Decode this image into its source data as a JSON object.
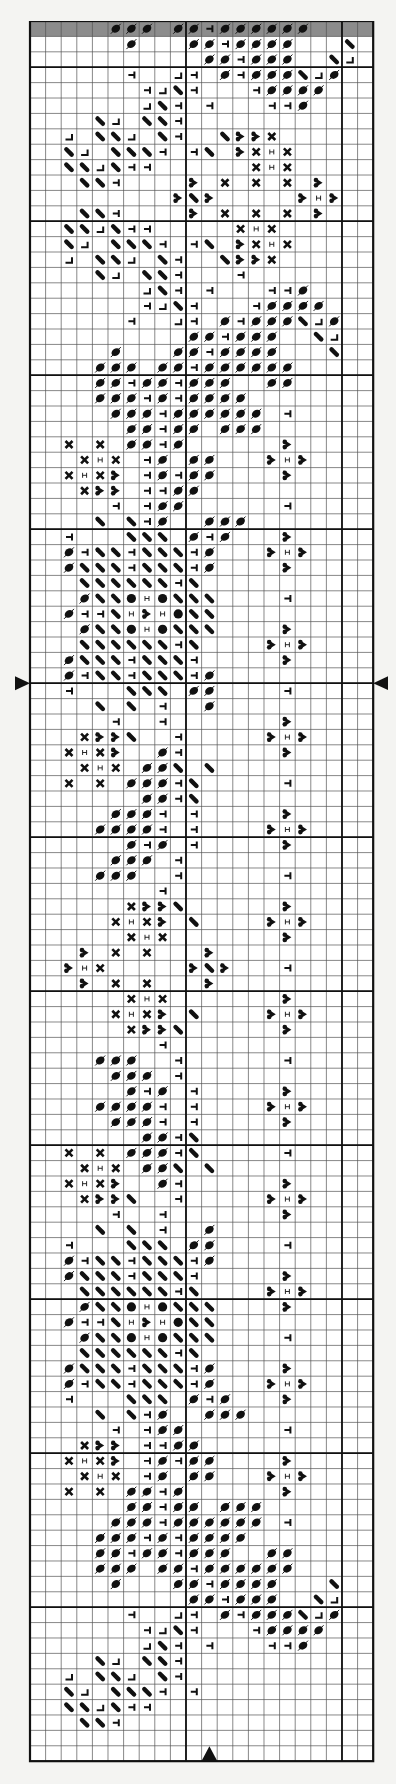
{
  "chart_data": {
    "type": "cross-stitch-pattern",
    "title": "",
    "columns": 22,
    "rows": 113,
    "cell_width": 15.6,
    "cell_height": 15.4,
    "bold_every": 10,
    "bold_row_offset": 3,
    "bold_columns": [
      10,
      20
    ],
    "shaded_rows": [
      0
    ],
    "center_markers": {
      "row_boundary": 43,
      "column": 11
    },
    "legend": {
      ".": "empty",
      "o": "oval-with-slash",
      "t": "tee-mark",
      "L": "corner-mark",
      "\\": "diagonal-bar",
      "h": "heart",
      "x": "cross",
      "I": "h-bar",
      "@": "filled-circle"
    },
    "grid": [
      ".....ooo.ootoooooo....",
      "......o...ootoooo...\\.",
      "...........ootooo..\\L.",
      "......t..Lt.otooo\\Lo..",
      ".......tL\\t...toooo...",
      ".......L\\t.t...tto....",
      "....\\L.\\\\t............",
      "..L.\\\\L.\\t..\\hhx......",
      "..\\L.\\\\\\t.t\\.hxIx.....",
      "..\\\\L\\tt......xIx.....",
      "...\\\\t....h.x.x.x.h...",
      ".........h\\h.....hIh..",
      "...\\\\t....h.x.x.x.h...",
      "..\\\\L\\tt.....xIx......",
      "..\\L.\\\\\\t.t\\.hxIx.....",
      "..L.\\\\L.\\t..\\hhx......",
      "....\\L.\\\\t...t........",
      ".......L\\t.t...tto....",
      ".......tL\\t...toooo...",
      "......t..Lt.otooo\\Lo..",
      "..........ootooo..\\L..",
      ".....o...ootoooo...\\..",
      "....ooo.ootoooooo.....",
      "....ootootooo..oo.....",
      "....ooototoooo........",
      ".....oootoooooo.t.....",
      "......ootoo.ooo.......",
      "..x.x.ooto......h.....",
      "...xIx.to.oo...hIh....",
      "..xIxh.totoo....h.....",
      "...xhh.ttoo...........",
      ".....t.too......t.....",
      "....\\.\\to..ooo........",
      "..t...\\\\\\.oto...h.....",
      "..ot\\\\t\\\\\\to...hIh....",
      "..o\\\\\\t\\\\\\to....h.....",
      "...\\\\\\\\\\\\t\\...........",
      "...o\\\\@I@\\\\\\....t.....",
      "..ott\\IhI@\\\\..........",
      "...o\\\\@I@\\\\\\....h.....",
      "...\\\\\\\\\\\\t\\....hIh....",
      "..o\\\\\\t\\\\\\t.....h.....",
      "..ot\\\\t\\\\\\to..........",
      "..t...\\\\\\.oo....t.....",
      "....\\.\\.t..o..........",
      ".....t..t.......h.....",
      "...xhh\\..t.....hIh....",
      "..xIxh..ot......h.....",
      "...xIx.oo\\.\\..........",
      "..x.x.ooot\\.....t.....",
      ".......oot\\...........",
      ".....ooot.t.....h.....",
      "....oooot.t....hIh....",
      "......oto.t.....h.....",
      ".....ooo.t............",
      "....ooo..t......t.....",
      "........t.............",
      "......xhh\\......h.....",
      ".....xIxh.\\....hIh....",
      "......xIx.......h.....",
      "...h.x.x...h..........",
      "..hIx.....h\\h...t.....",
      "...h.x.x...h..........",
      "......xIx.......h.....",
      ".....xIxh.\\....hIh....",
      "......xhh\\......h.....",
      "........t.............",
      "....ooo..t......t.....",
      ".....ooo.t............",
      "......oto.t.....h.....",
      "....oooot.t....hIh....",
      ".....ooot.t.....h.....",
      ".......oot\\...........",
      "..x.x.ooot\\.....t.....",
      "...xIx.oo\\.\\..........",
      "..xIxh..ot......h.....",
      "...xhh\\..t.....hIh....",
      ".....t..t.......h.....",
      "....\\.\\.t..o..........",
      "..t...\\\\\\.oo....t.....",
      "..ot\\\\t\\\\\\to..........",
      "..o\\\\\\t\\\\\\t.....h.....",
      "...\\\\\\\\\\\\t\\....hIh....",
      "...o\\\\@I@\\\\\\....h.....",
      "..ott\\IhI@\\\\..........",
      "...o\\\\@I@\\\\\\....t.....",
      "...\\\\\\\\\\\\t\\...........",
      "..o\\\\\\t\\\\\\to....h.....",
      "..ot\\\\t\\\\\\to...hIh....",
      "..t...\\\\\\.oto...h.....",
      "....\\.\\to..ooo........",
      ".....t.too......t.....",
      "...xhh.ttoo...........",
      "..xIxh.totoo....h.....",
      "...xIx.to.oo...hIh....",
      "..x.x.ooto......h.....",
      "......ootoo.ooo.......",
      ".....oootoooooo.t.....",
      "....ooototoooo........",
      "....ootootooo..oo.....",
      "....ooo.ootoooooo.....",
      ".....o...ootoooo...\\..",
      "..........ootooo..\\L..",
      "......t..Lt.otooo\\Lo..",
      ".......tL\\t...toooo...",
      ".......L\\t.t...tto....",
      "....\\L.\\\\t............",
      "..L.\\\\L.\\t............",
      "..\\L.\\\\\\t.t...........",
      "..\\\\L\\tt..............",
      "...\\\\t................",
      "......................",
      "......................"
    ]
  },
  "colors": {
    "background": "#f4f4f2",
    "cell": "#ffffff",
    "shaded": "#8c8c8c",
    "grid_line": "#555555",
    "bold_line": "#111111",
    "symbol": "#111111"
  }
}
